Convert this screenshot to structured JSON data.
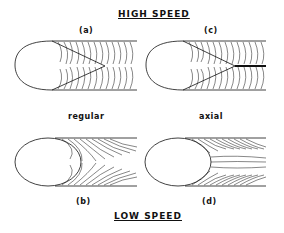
{
  "figure": {
    "top_title": "HIGH SPEED",
    "bottom_title": "LOW SPEED",
    "column_labels": {
      "left": "regular",
      "right": "axial"
    },
    "panels": [
      {
        "id": "a",
        "label": "(a)",
        "speed": "high",
        "mode": "regular"
      },
      {
        "id": "b",
        "label": "(b)",
        "speed": "low",
        "mode": "regular"
      },
      {
        "id": "c",
        "label": "(c)",
        "speed": "high",
        "mode": "axial"
      },
      {
        "id": "d",
        "label": "(d)",
        "speed": "low",
        "mode": "axial"
      }
    ]
  }
}
